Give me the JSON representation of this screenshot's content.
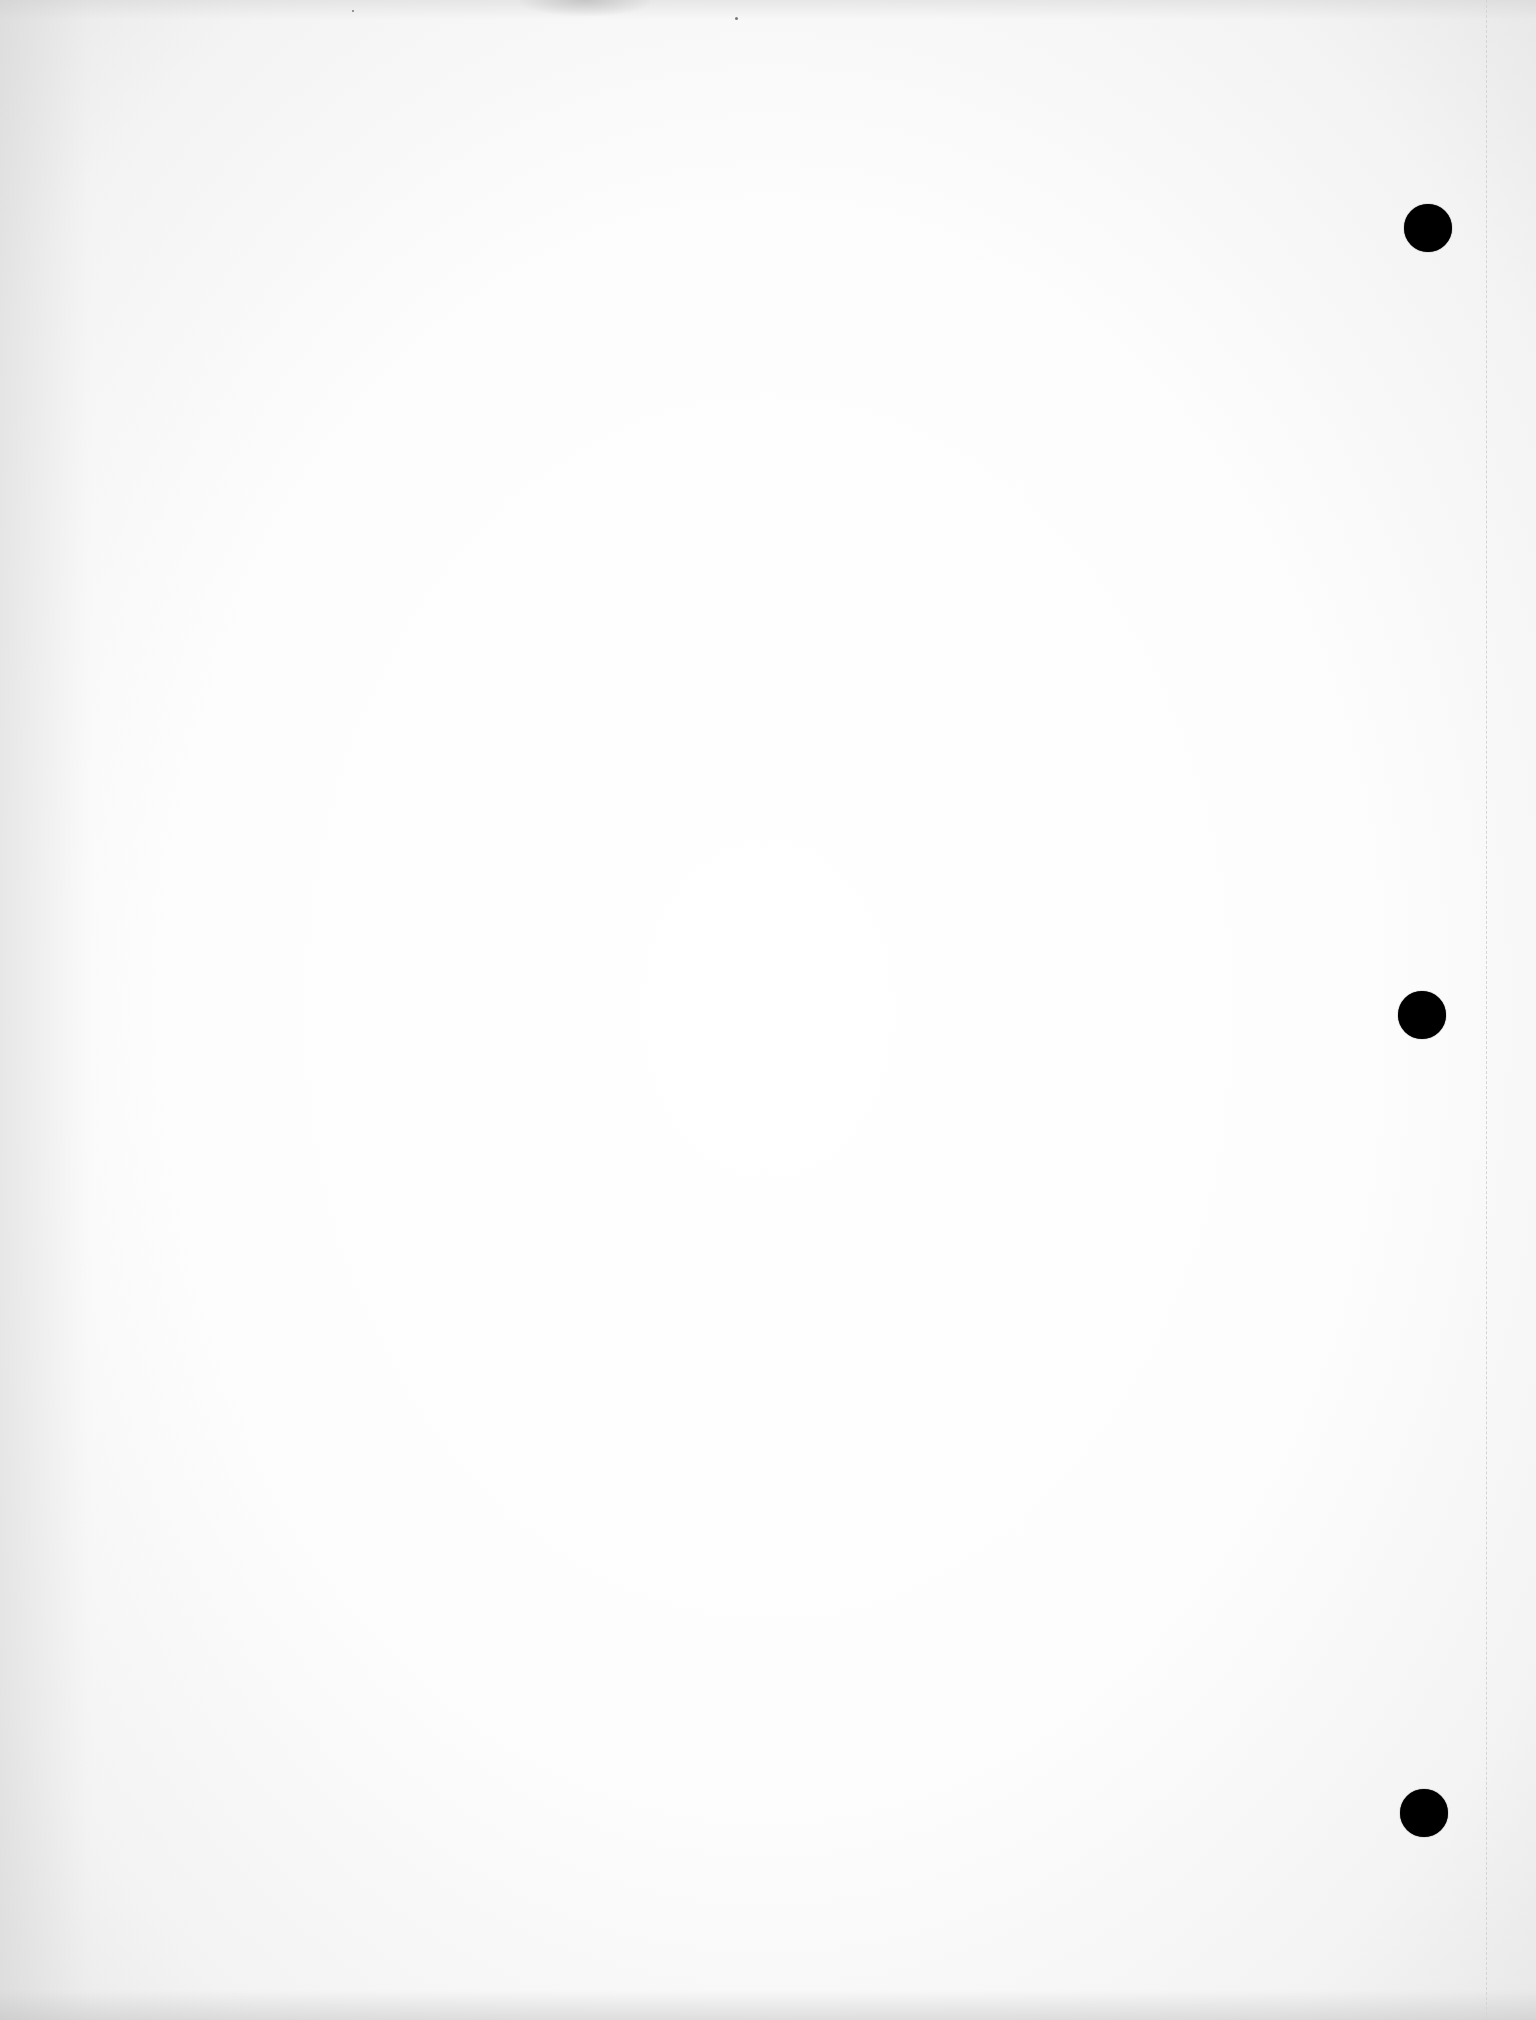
{
  "document": {
    "type": "blank-scanned-page",
    "text_content": "",
    "background_color": "#ffffff",
    "hole_color": "#000000",
    "punch_holes": [
      {
        "label": "top-hole",
        "cx": 1428,
        "cy": 228,
        "diameter": 48
      },
      {
        "label": "middle-hole",
        "cx": 1422,
        "cy": 1015,
        "diameter": 48
      },
      {
        "label": "bottom-hole",
        "cx": 1424,
        "cy": 1813,
        "diameter": 48
      }
    ],
    "fold_line": {
      "x": 1486,
      "style": "dashed",
      "color": "#d4d4d4"
    }
  }
}
